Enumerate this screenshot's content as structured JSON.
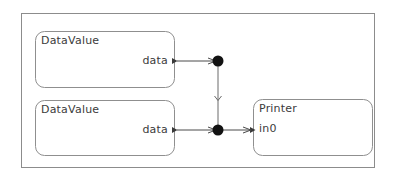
{
  "diagram": {
    "kind": "block-diagram",
    "background_color": "#ffffff",
    "frame": {
      "name": "composite-frame",
      "stroke_color": "#808080",
      "x": 21,
      "y": 13,
      "width": 354,
      "height": 155
    },
    "nodes": [
      {
        "id": "datavalue-1",
        "title": "DataValue",
        "x": 35,
        "y": 31,
        "width": 140,
        "height": 57,
        "stroke_color": "#8a8a8a",
        "fill_color": "#ffffff",
        "ports": [
          {
            "id": "datavalue-1-out",
            "label": "data",
            "side": "right",
            "kind": "output",
            "x": 175,
            "y": 61
          }
        ]
      },
      {
        "id": "datavalue-2",
        "title": "DataValue",
        "x": 35,
        "y": 100,
        "width": 140,
        "height": 56,
        "stroke_color": "#8a8a8a",
        "fill_color": "#ffffff",
        "ports": [
          {
            "id": "datavalue-2-out",
            "label": "data",
            "side": "right",
            "kind": "output",
            "x": 175,
            "y": 130
          }
        ]
      },
      {
        "id": "printer-1",
        "title": "Printer",
        "x": 253,
        "y": 99,
        "width": 120,
        "height": 57,
        "stroke_color": "#8a8a8a",
        "fill_color": "#ffffff",
        "ports": [
          {
            "id": "printer-1-in0",
            "label": "in0",
            "side": "left",
            "kind": "input",
            "x": 253,
            "y": 130
          }
        ]
      }
    ],
    "junctions": [
      {
        "id": "junction-top",
        "x": 218,
        "y": 61,
        "radius": 5,
        "color": "#000000"
      },
      {
        "id": "junction-bottom",
        "x": 218,
        "y": 130,
        "radius": 5,
        "color": "#000000"
      }
    ],
    "links": [
      {
        "id": "link-datavalue1-to-junction-top",
        "from": "datavalue-1-out",
        "to": "junction-top",
        "color": "#4a4a4a"
      },
      {
        "id": "link-datavalue2-to-junction-bottom",
        "from": "datavalue-2-out",
        "to": "junction-bottom",
        "color": "#4a4a4a"
      },
      {
        "id": "link-junction-top-to-junction-bottom",
        "from": "junction-top",
        "to": "junction-bottom",
        "color": "#4a4a4a"
      },
      {
        "id": "link-junction-bottom-to-printer",
        "from": "junction-bottom",
        "to": "printer-1-in0",
        "color": "#4a4a4a"
      }
    ]
  },
  "labels": {
    "datavalue_1_title": "DataValue",
    "datavalue_1_port": "data",
    "datavalue_2_title": "DataValue",
    "datavalue_2_port": "data",
    "printer_title": "Printer",
    "printer_port": "in0"
  }
}
